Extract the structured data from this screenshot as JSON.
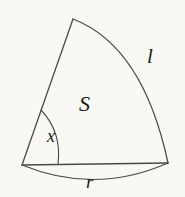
{
  "figure": {
    "kind": "circular-sector-geometry-diagram",
    "background_color": "#f9f8f4",
    "stroke_color": "#4a4a46",
    "text_color": "#1b1b1b",
    "labels": {
      "area": "S",
      "arc_length": "l",
      "angle": "x",
      "radius": "r"
    },
    "geometry": {
      "vertex": [
        22,
        165
      ],
      "top_point": [
        73,
        19
      ],
      "right_point": [
        168,
        163
      ],
      "arc_control": [
        140,
        50
      ],
      "radius_arc_bulge": [
        95,
        186
      ],
      "angle_marker_start": [
        42,
        137
      ],
      "angle_marker_end": [
        62,
        164
      ]
    }
  }
}
